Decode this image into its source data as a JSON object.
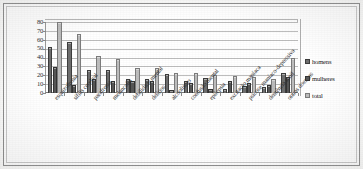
{
  "chart_data": {
    "type": "bar",
    "title": "",
    "subtitle": "",
    "xlabel": "",
    "ylabel": "",
    "ylim": [
      0,
      80
    ],
    "yticks": [
      "0",
      "10",
      "20",
      "30",
      "40",
      "50",
      "60",
      "70",
      "80"
    ],
    "grid": true,
    "legend_position": "right",
    "categories": [
      "esquizofrenia",
      "sífilis cerebral",
      "parafrenia",
      "melancolia",
      "debilidade mental",
      "delírios",
      "alcoolismo",
      "confusão mental",
      "epilepsia",
      "excitação maníaca",
      "psicose maníaco-depressiva",
      "demência senil",
      "outras doenças"
    ],
    "series": [
      {
        "name": "homens",
        "color": "#6e6e6e",
        "values": [
          52,
          58,
          26,
          26,
          16,
          16,
          21,
          13,
          17,
          5,
          8,
          7,
          23
        ]
      },
      {
        "name": "mulheres",
        "color": "#575757",
        "values": [
          29,
          9,
          16,
          13,
          14,
          14,
          3,
          11,
          4,
          14,
          11,
          9,
          18
        ]
      },
      {
        "name": "total",
        "color": "#bdbdbd",
        "values": [
          80,
          66,
          42,
          38,
          28,
          28,
          22,
          22,
          20,
          19,
          18,
          16,
          39
        ]
      }
    ]
  },
  "legend": {
    "items": [
      {
        "label": "homens",
        "swatch": "homens"
      },
      {
        "label": "mulheres",
        "swatch": "mulheres"
      },
      {
        "label": "total",
        "swatch": "total"
      }
    ]
  }
}
